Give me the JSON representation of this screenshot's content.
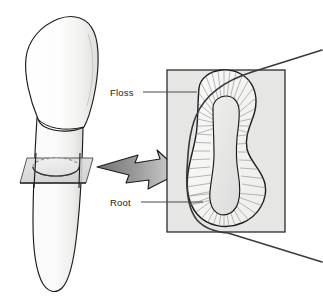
{
  "figure": {
    "background_color": "#ffffff"
  },
  "labels": [
    {
      "id": "floss",
      "text": "Floss",
      "leader": "horizontal-line-to-root-outline"
    },
    {
      "id": "root",
      "text": "Root",
      "leader": "horizontal-line-to-root-body"
    }
  ],
  "left_illustration": {
    "name": "tooth-side-view",
    "parts": {
      "crown": "crown",
      "root": "root",
      "section_plane": "cutting-plane",
      "section_ellipse": "cross-section-ellipse"
    },
    "colors": {
      "outline": "#1c1c1c",
      "fill_light": "#fdfdfd",
      "fill_shade": "#e8e8e6",
      "plane_fill": "#d9d9d9",
      "plane_edge": "#4a4a4a"
    }
  },
  "arrow": {
    "name": "magnify-arrow",
    "direction": "right",
    "colors": {
      "fill_start": "#6e6e6e",
      "fill_end": "#d2d2d2",
      "outline": "#1c1c1c"
    }
  },
  "right_illustration": {
    "name": "root-cross-section",
    "panel": {
      "fill": "#e6e6e4",
      "border": "#1c1c1c"
    },
    "parts": {
      "outer_outline": "root-outer-boundary",
      "pulp_cavity": "pulp-cavity",
      "tubules": "dentinal-tubule-lines",
      "floss_strand": "floss-strand"
    },
    "colors": {
      "outline": "#1c1c1c",
      "dentin_fill": "#f2f2f0",
      "pulp_fill": "#e4e4e2",
      "tubule_line": "#8a8a8a",
      "floss_line": "#3a3a3a"
    },
    "tubule_count": 64
  }
}
